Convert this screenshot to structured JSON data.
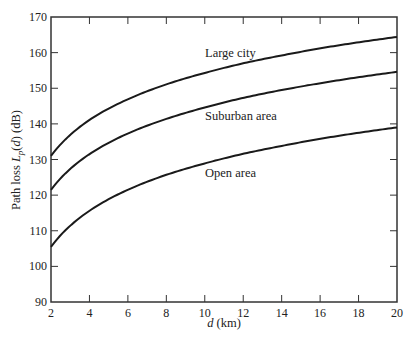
{
  "chart_data": {
    "type": "line",
    "title": "",
    "xlabel": "d (km)",
    "xlabel_parts": {
      "var": "d",
      "unit": " (km)"
    },
    "ylabel": "Path loss L_p(d) (dB)",
    "ylabel_parts": {
      "prefix": "Path loss ",
      "var": "L",
      "sub": "p",
      "rest": "(",
      "arg": "d",
      "suffix": ") (dB)"
    },
    "xlim": [
      2,
      20
    ],
    "ylim": [
      90,
      170
    ],
    "xticks": [
      2,
      4,
      6,
      8,
      10,
      12,
      14,
      16,
      18,
      20
    ],
    "yticks": [
      90,
      100,
      110,
      120,
      130,
      140,
      150,
      160,
      170
    ],
    "grid": false,
    "legend": "inline labels",
    "x": [
      2,
      4,
      6,
      8,
      10,
      12,
      14,
      16,
      18,
      20
    ],
    "series": [
      {
        "name": "Large city",
        "values": [
          131.0,
          141.1,
          146.9,
          151.1,
          154.3,
          157.0,
          159.2,
          161.2,
          162.9,
          164.4
        ],
        "label_pos": [
          205,
          57
        ]
      },
      {
        "name": "Suburban area",
        "values": [
          121.5,
          131.5,
          137.3,
          141.4,
          144.6,
          147.3,
          149.5,
          151.4,
          153.1,
          154.6
        ],
        "label_pos": [
          205,
          120
        ]
      },
      {
        "name": "Open area",
        "values": [
          105.5,
          115.6,
          121.5,
          125.7,
          128.9,
          131.6,
          133.8,
          135.8,
          137.5,
          139.0
        ],
        "label_pos": [
          205,
          177
        ]
      }
    ],
    "colors": {
      "line": "#1a1a1a",
      "axis": "#333333",
      "text": "#222222"
    }
  }
}
